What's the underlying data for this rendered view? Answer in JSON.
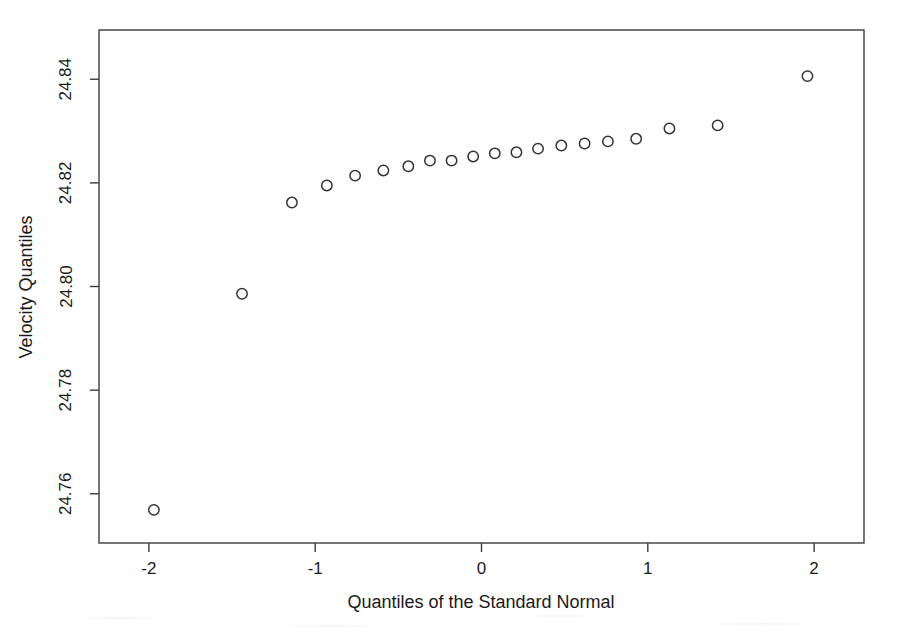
{
  "chart_data": {
    "type": "scatter",
    "title": "",
    "subtitle": "",
    "xlabel": "Quantiles of the Standard Normal",
    "ylabel": "Velocity Quantiles",
    "xlim": [
      -2.3,
      2.3
    ],
    "ylim": [
      24.7505,
      24.8495
    ],
    "xticks": [
      -2,
      -1,
      0,
      1,
      2
    ],
    "xtick_labels": [
      "-2",
      "-1",
      "0",
      "1",
      "2"
    ],
    "yticks": [
      24.76,
      24.78,
      24.8,
      24.82,
      24.84
    ],
    "ytick_labels": [
      "24.76",
      "24.78",
      "24.80",
      "24.82",
      "24.84"
    ],
    "grid": false,
    "legend": null,
    "marker": "open-circle",
    "marker_color": "#333333",
    "frame_color": "#3c3c3c",
    "background": "#ffffff",
    "n_points": 24,
    "x": [
      -1.97,
      -1.44,
      -1.14,
      -0.93,
      -0.76,
      -0.59,
      -0.44,
      -0.31,
      -0.18,
      -0.05,
      0.08,
      0.21,
      0.34,
      0.48,
      0.62,
      0.76,
      0.93,
      1.13,
      1.42,
      1.96,
      0.0,
      0.0,
      0.0,
      0.0
    ],
    "y": [
      24.7569,
      24.7986,
      24.8162,
      24.8195,
      24.8214,
      24.8224,
      24.8232,
      24.8243,
      24.8243,
      24.8251,
      24.8257,
      24.8259,
      24.8266,
      24.8272,
      24.8276,
      24.828,
      24.8285,
      24.8305,
      24.8311,
      24.8406,
      0.0,
      0.0,
      0.0,
      0.0
    ],
    "points": [
      {
        "x": -1.97,
        "y": 24.7569
      },
      {
        "x": -1.44,
        "y": 24.7986
      },
      {
        "x": -1.14,
        "y": 24.8162
      },
      {
        "x": -0.93,
        "y": 24.8195
      },
      {
        "x": -0.76,
        "y": 24.8214
      },
      {
        "x": -0.59,
        "y": 24.8224
      },
      {
        "x": -0.44,
        "y": 24.8232
      },
      {
        "x": -0.31,
        "y": 24.8243
      },
      {
        "x": -0.18,
        "y": 24.8243
      },
      {
        "x": -0.05,
        "y": 24.8251
      },
      {
        "x": 0.08,
        "y": 24.8257
      },
      {
        "x": 0.21,
        "y": 24.8259
      },
      {
        "x": 0.34,
        "y": 24.8266
      },
      {
        "x": 0.48,
        "y": 24.8272
      },
      {
        "x": 0.62,
        "y": 24.8276
      },
      {
        "x": 0.76,
        "y": 24.828
      },
      {
        "x": 0.93,
        "y": 24.8285
      },
      {
        "x": 1.13,
        "y": 24.8305
      },
      {
        "x": 1.42,
        "y": 24.8311
      },
      {
        "x": 1.96,
        "y": 24.8406
      }
    ]
  },
  "figure": {
    "xlabel": "Quantiles of the Standard Normal",
    "ylabel": "Velocity Quantiles"
  }
}
